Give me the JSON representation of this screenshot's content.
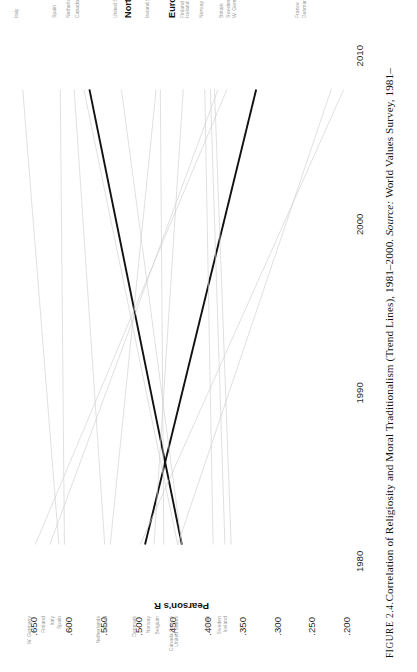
{
  "caption": {
    "figure_label": "FIGURE 2.4.",
    "text": "Correlation of Religiosity and Moral Traditionalism (Trend Lines), 1981–2000. ",
    "source_prefix": "Source:",
    "source_text": " World Values Survey, 1981–"
  },
  "chart_data": {
    "type": "line",
    "title": "Correlation of Religiosity and Moral Traditionalism (Trend Lines), 1981–2000",
    "xlabel": "",
    "ylabel": "Pearson's R",
    "xlim": [
      1977,
      2012
    ],
    "ylim": [
      0.2,
      0.675
    ],
    "grid": false,
    "legend_position": "inline-end-labels",
    "x": [
      1981,
      2000
    ],
    "xticks": [
      1980,
      1990,
      2000,
      2010
    ],
    "xtick_labels": [
      "1980",
      "1990",
      "2000",
      "2010"
    ],
    "yticks": [
      0.65,
      0.6,
      0.55,
      0.5,
      0.45,
      0.4,
      0.35,
      0.3,
      0.25,
      0.2
    ],
    "ytick_labels": [
      ".650",
      ".600",
      ".550",
      ".500",
      ".450",
      ".400",
      ".350",
      ".300",
      ".250",
      ".200"
    ],
    "series": [
      {
        "name": "North America",
        "emphasis": "bold",
        "color": "#111111",
        "start_year": 1981,
        "end_year": 2008,
        "start_value": 0.49,
        "end_value": 0.33
      },
      {
        "name": "Europe",
        "emphasis": "bold",
        "color": "#111111",
        "start_year": 1981,
        "end_year": 2008,
        "start_value": 0.437,
        "end_value": 0.57
      },
      {
        "name": "W. Germany",
        "emphasis": "thin",
        "color": "#cfcfcf",
        "start_year": 1981,
        "end_year": 2008,
        "start_value": 0.648,
        "end_value": 0.372
      },
      {
        "name": "Finland",
        "emphasis": "thin",
        "color": "#cfcfcf",
        "start_year": 1981,
        "end_year": 2008,
        "start_value": 0.627,
        "end_value": 0.385
      },
      {
        "name": "Italy",
        "emphasis": "thin",
        "color": "#cfcfcf",
        "start_year": 1981,
        "end_year": 2008,
        "start_value": 0.614,
        "end_value": 0.666
      },
      {
        "name": "Spain",
        "emphasis": "thin",
        "color": "#cfcfcf",
        "start_year": 1981,
        "end_year": 2008,
        "start_value": 0.606,
        "end_value": 0.612
      },
      {
        "name": "Netherlands",
        "emphasis": "thin",
        "color": "#cfcfcf",
        "start_year": 1981,
        "end_year": 2008,
        "start_value": 0.548,
        "end_value": 0.592
      },
      {
        "name": "Ireland",
        "emphasis": "thin",
        "color": "#cfcfcf",
        "start_year": 1981,
        "end_year": 2008,
        "start_value": 0.54,
        "end_value": 0.474
      },
      {
        "name": "Denmark",
        "emphasis": "thin",
        "color": "#cfcfcf",
        "start_year": 1981,
        "end_year": 2008,
        "start_value": 0.497,
        "end_value": 0.204
      },
      {
        "name": "Norway",
        "emphasis": "thin",
        "color": "#cfcfcf",
        "start_year": 1981,
        "end_year": 2008,
        "start_value": 0.477,
        "end_value": 0.435
      },
      {
        "name": "Belgium",
        "emphasis": "thin",
        "color": "#cfcfcf",
        "start_year": 1981,
        "end_year": 2008,
        "start_value": 0.463,
        "end_value": 0.468
      },
      {
        "name": "Canada",
        "emphasis": "thin",
        "color": "#cfcfcf",
        "start_year": 1981,
        "end_year": 2008,
        "start_value": 0.443,
        "end_value": 0.578
      },
      {
        "name": "France",
        "emphasis": "thin",
        "color": "#cfcfcf",
        "start_year": 1981,
        "end_year": 2008,
        "start_value": 0.443,
        "end_value": 0.222
      },
      {
        "name": "United States",
        "emphasis": "thin",
        "color": "#cfcfcf",
        "start_year": 1981,
        "end_year": 2008,
        "start_value": 0.437,
        "end_value": 0.524
      },
      {
        "name": "Britain",
        "emphasis": "thin",
        "color": "#cfcfcf",
        "start_year": 1981,
        "end_year": 2008,
        "start_value": 0.392,
        "end_value": 0.404
      },
      {
        "name": "Sweden",
        "emphasis": "thin",
        "color": "#cfcfcf",
        "start_year": 1981,
        "end_year": 2008,
        "start_value": 0.375,
        "end_value": 0.396
      },
      {
        "name": "Iceland",
        "emphasis": "thin",
        "color": "#cfcfcf",
        "start_year": 1981,
        "end_year": 2008,
        "start_value": 0.366,
        "end_value": 0.39
      }
    ],
    "left_label_groups": [
      {
        "y": 0.648,
        "lines": [
          "W. Germany"
        ]
      },
      {
        "y": 0.627,
        "lines": [
          "Finland"
        ]
      },
      {
        "y": 0.614,
        "lines": [
          "Italy"
        ]
      },
      {
        "y": 0.604,
        "lines": [
          "Spain"
        ]
      },
      {
        "y": 0.548,
        "lines": [
          "Netherlands"
        ]
      },
      {
        "y": 0.538,
        "lines": [
          "Ireland"
        ]
      },
      {
        "y": 0.497,
        "lines": [
          "Denmark"
        ]
      },
      {
        "y": 0.477,
        "lines": [
          "Norway"
        ]
      },
      {
        "y": 0.463,
        "lines": [
          "Belgium"
        ]
      },
      {
        "y": 0.444,
        "lines": [
          "Canada France"
        ]
      },
      {
        "y": 0.436,
        "lines": [
          "United States"
        ]
      },
      {
        "y": 0.392,
        "lines": [
          "Britain"
        ]
      },
      {
        "y": 0.374,
        "lines": [
          "Sweden"
        ]
      },
      {
        "y": 0.366,
        "lines": [
          "Iceland"
        ]
      }
    ],
    "right_label_groups": [
      {
        "y": 0.666,
        "lines": [
          "Italy"
        ],
        "bold": false
      },
      {
        "y": 0.612,
        "lines": [
          "Spain"
        ],
        "bold": false
      },
      {
        "y": 0.592,
        "lines": [
          "Netherlands"
        ],
        "bold": false
      },
      {
        "y": 0.578,
        "lines": [
          "Canada"
        ],
        "bold": false
      },
      {
        "y": 0.524,
        "lines": [
          "United States"
        ],
        "bold": false
      },
      {
        "y": 0.505,
        "lines": [
          "North America"
        ],
        "bold": true
      },
      {
        "y": 0.478,
        "lines": [
          "Ireland  Belgium"
        ],
        "bold": false
      },
      {
        "y": 0.442,
        "lines": [
          "Europe"
        ],
        "bold": true
      },
      {
        "y": 0.428,
        "lines": [
          "Finland"
        ],
        "bold": false
      },
      {
        "y": 0.42,
        "lines": [
          "Iceland"
        ],
        "bold": false
      },
      {
        "y": 0.4,
        "lines": [
          "Norway"
        ],
        "bold": false
      },
      {
        "y": 0.372,
        "lines": [
          "Britain"
        ],
        "bold": false
      },
      {
        "y": 0.362,
        "lines": [
          "Sweden"
        ],
        "bold": false
      },
      {
        "y": 0.352,
        "lines": [
          "W. Germany"
        ],
        "bold": false
      },
      {
        "y": 0.262,
        "lines": [
          "France"
        ],
        "bold": false
      },
      {
        "y": 0.252,
        "lines": [
          "Denmark"
        ],
        "bold": false
      }
    ]
  }
}
